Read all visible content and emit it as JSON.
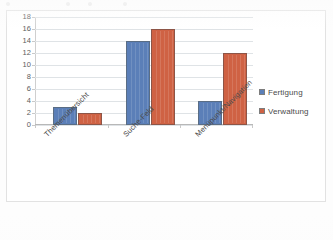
{
  "chart_data": {
    "type": "bar",
    "title": "",
    "subtitle": "",
    "xlabel": "",
    "ylabel": "",
    "categories": [
      "Themenübersicht",
      "Suche-Feld",
      "Menüpunkt/Navigation"
    ],
    "series": [
      {
        "name": "Fertigung",
        "color": "#5b7fb8",
        "values": [
          3,
          14,
          4
        ]
      },
      {
        "name": "Verwaltung",
        "color": "#cf6244",
        "values": [
          2,
          16,
          12
        ]
      }
    ],
    "ylim": [
      0,
      18
    ],
    "ytick_step": 2,
    "yticks": [
      "0",
      "2",
      "4",
      "6",
      "8",
      "10",
      "12",
      "14",
      "16",
      "18"
    ],
    "grid": "horizontal",
    "legend_position": "right",
    "category_label_rotation": -45
  },
  "legend": {
    "entries": [
      {
        "label": "Fertigung",
        "swatch": "legend-swatch-fertigung"
      },
      {
        "label": "Verwaltung",
        "swatch": "legend-swatch-verwaltung"
      }
    ]
  },
  "colors": {
    "series_fertigung": "#5b7fb8",
    "series_verwaltung": "#cf6244",
    "gridline": "#dfe3e6",
    "axis": "#b8b8b8",
    "frame": "#e2e2e2",
    "text": "#4a4a4a",
    "background": "#ffffff"
  }
}
